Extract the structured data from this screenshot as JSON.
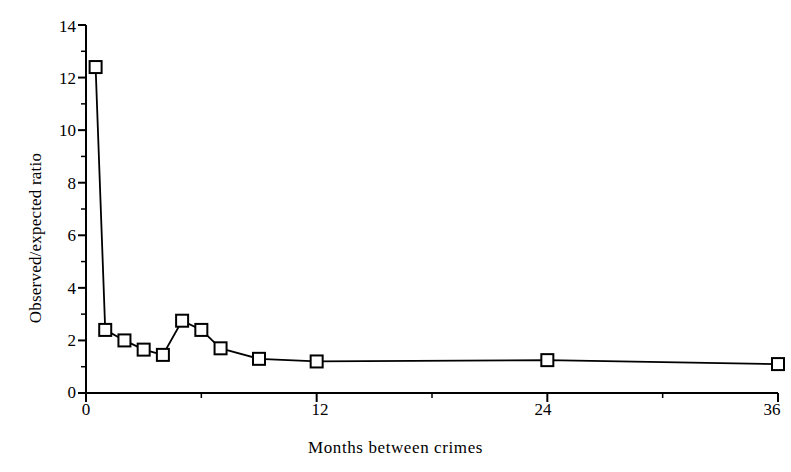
{
  "chart_data": {
    "type": "line",
    "title": "",
    "subtitle": "",
    "xlabel": "Months between crimes",
    "ylabel": "Observed/expected ratio",
    "xlim": [
      0,
      36
    ],
    "ylim": [
      0,
      14
    ],
    "xticks": [
      0,
      12,
      24,
      36
    ],
    "xtick_labels": [
      "0",
      "12",
      "24",
      "36"
    ],
    "xminorticks": [
      6,
      18,
      30
    ],
    "yticks": [
      0,
      2,
      4,
      6,
      8,
      10,
      12,
      14
    ],
    "ytick_labels": [
      "0",
      "2",
      "4",
      "6",
      "8",
      "10",
      "12",
      "14"
    ],
    "yminorticks": [
      1,
      3,
      5,
      7,
      9,
      11,
      13
    ],
    "grid": false,
    "legend": null,
    "marker": "open-square",
    "line_color": "#000000",
    "marker_face_color": "#ffffff",
    "marker_edge_color": "#000000",
    "series": [
      {
        "name": "Observed/expected ratio",
        "x": [
          0.5,
          1.0,
          2.0,
          3.0,
          4.0,
          5.0,
          6.0,
          7.0,
          9.0,
          12.0,
          24.0,
          36.0
        ],
        "values": [
          12.4,
          2.4,
          2.0,
          1.65,
          1.45,
          2.75,
          2.4,
          1.7,
          1.3,
          1.2,
          1.25,
          1.1
        ]
      }
    ],
    "annotations": []
  },
  "axis_labels": {
    "y_title": "Observed/expected ratio",
    "x_title": "Months between crimes"
  }
}
